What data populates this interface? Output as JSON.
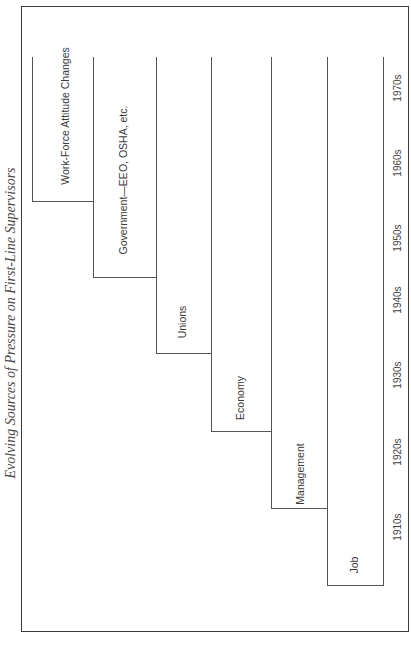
{
  "title": "Evolving Sources of Pressure on First-Line Supervisors",
  "sources": [
    {
      "label": "Job",
      "starts": "1910s"
    },
    {
      "label": "Management",
      "starts": "1920s"
    },
    {
      "label": "Economy",
      "starts": "1930s"
    },
    {
      "label": "Unions",
      "starts": "1940s"
    },
    {
      "label": "Government—EEO, OSHA, etc.",
      "starts": "1950s"
    },
    {
      "label": "Work-Force Attitude Changes",
      "starts": "1960s"
    }
  ],
  "decades": [
    "1910s",
    "1920s",
    "1930s",
    "1940s",
    "1950s",
    "1960s",
    "1970s"
  ],
  "colors": {
    "line": "#555555",
    "frame": "#3a3a3a",
    "text": "#3a3a3a"
  }
}
